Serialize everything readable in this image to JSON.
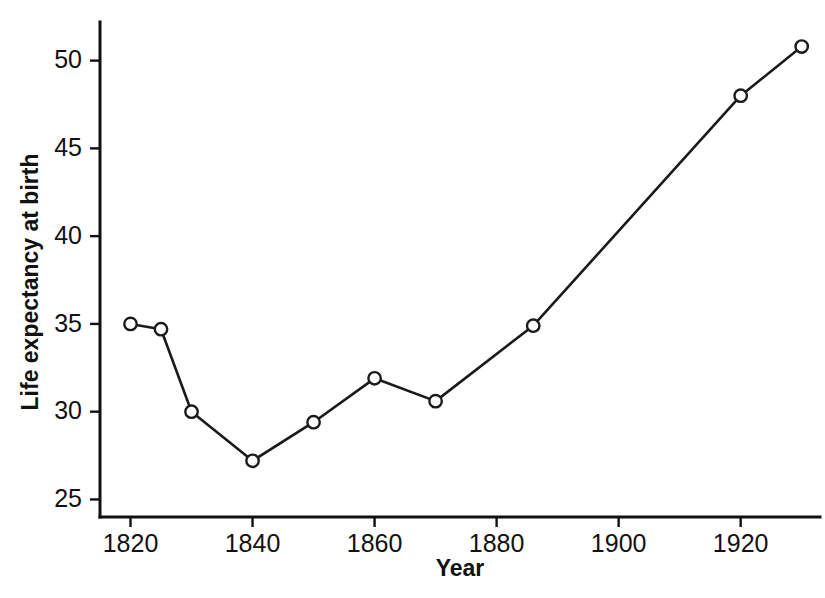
{
  "chart_data": {
    "type": "line",
    "title": "",
    "xlabel": "Year",
    "ylabel": "Life expectancy at birth",
    "xlim": [
      1815,
      1933
    ],
    "ylim": [
      24.0,
      52.2
    ],
    "xticks": [
      1820,
      1840,
      1860,
      1880,
      1900,
      1920
    ],
    "xtick_labels": [
      "1820",
      "1840",
      "1860",
      "1880",
      "1900",
      "1920"
    ],
    "yticks": [
      25,
      30,
      35,
      40,
      45,
      50
    ],
    "ytick_labels": [
      "25",
      "30",
      "35",
      "40",
      "45",
      "50"
    ],
    "grid": false,
    "legend": false,
    "legend_position": "none",
    "marker": "open-circle",
    "line_color": "#1a1a1a",
    "marker_face_color": "#ffffff",
    "background_color": "#ffffff",
    "x": [
      1820,
      1825,
      1830,
      1840,
      1850,
      1860,
      1870,
      1886,
      1920,
      1930
    ],
    "values": [
      35.0,
      34.7,
      30.0,
      27.2,
      29.4,
      31.9,
      30.6,
      34.9,
      48.0,
      50.8
    ],
    "points": [
      {
        "x": 1820,
        "y": 35.0
      },
      {
        "x": 1825,
        "y": 34.7
      },
      {
        "x": 1830,
        "y": 30.0
      },
      {
        "x": 1840,
        "y": 27.2
      },
      {
        "x": 1850,
        "y": 29.4
      },
      {
        "x": 1860,
        "y": 31.9
      },
      {
        "x": 1870,
        "y": 30.6
      },
      {
        "x": 1886,
        "y": 34.9
      },
      {
        "x": 1920,
        "y": 48.0
      },
      {
        "x": 1930,
        "y": 50.8
      }
    ]
  },
  "axes": {
    "x_title": "Year",
    "y_title": "Life expectancy at birth"
  }
}
